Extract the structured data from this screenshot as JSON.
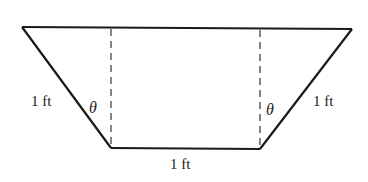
{
  "diagram": {
    "shape": "isosceles trapezoid (trough cross-section)",
    "colors": {
      "stroke": "#1a1a1a",
      "text": "#222222",
      "background": "#ffffff"
    },
    "labels": {
      "left_side": "1 ft",
      "right_side": "1 ft",
      "bottom": "1 ft",
      "left_angle": "θ",
      "right_angle": "θ"
    },
    "vertices": {
      "top_left": [
        22,
        27
      ],
      "top_right": [
        352,
        29
      ],
      "bottom_right": [
        260,
        149
      ],
      "bottom_left": [
        111,
        148
      ]
    },
    "dashed_lines": [
      {
        "x": 111,
        "y1": 28,
        "y2": 148
      },
      {
        "x": 260,
        "y1": 29,
        "y2": 149
      }
    ]
  }
}
